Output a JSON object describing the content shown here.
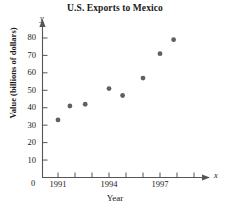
{
  "chart_data": {
    "type": "scatter",
    "title": "U.S. Exports to Mexico",
    "xlabel": "Year",
    "ylabel": "Value (billions of dollars)",
    "x_axis_variable": "x",
    "y_axis_variable": "y",
    "origin_label": "0",
    "x": [
      1991,
      1992,
      1993,
      1994,
      1995,
      1996,
      1997,
      1998
    ],
    "xlim": [
      1990.4,
      1999.2
    ],
    "ylim": [
      0,
      88
    ],
    "y_ticks": [
      10,
      20,
      30,
      40,
      50,
      60,
      70,
      80
    ],
    "y_tick_labels": [
      "10",
      "20",
      "30",
      "40",
      "50",
      "60",
      "70",
      "80"
    ],
    "x_ticks": [
      1991,
      1992,
      1993,
      1994,
      1995,
      1996,
      1997,
      1998,
      1999
    ],
    "x_tick_labels": [
      "1991",
      "",
      "",
      "1994",
      "",
      "",
      "1997",
      "",
      ""
    ],
    "grid": false,
    "legend": false,
    "points": [
      {
        "x": 1991.0,
        "y": 33
      },
      {
        "x": 1991.7,
        "y": 41
      },
      {
        "x": 1992.6,
        "y": 42
      },
      {
        "x": 1994.0,
        "y": 51
      },
      {
        "x": 1994.8,
        "y": 47
      },
      {
        "x": 1996.0,
        "y": 57
      },
      {
        "x": 1997.0,
        "y": 71
      },
      {
        "x": 1997.8,
        "y": 79
      }
    ],
    "series": [
      {
        "name": "U.S. Exports to Mexico",
        "values": [
          33,
          41,
          42,
          51,
          47,
          57,
          71,
          79
        ]
      }
    ],
    "marker_color": "#606060",
    "axis_color": "#555555"
  }
}
